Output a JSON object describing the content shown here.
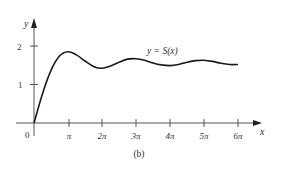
{
  "chart_data": {
    "type": "line",
    "title": "",
    "caption": "(b)",
    "xlabel": "x",
    "ylabel": "y",
    "curve_label": "y = S(x)",
    "x_ticks": [
      "π",
      "2π",
      "3π",
      "4π",
      "5π",
      "6π"
    ],
    "x_tick_values": [
      3.1416,
      6.2832,
      9.4248,
      12.5664,
      15.708,
      18.8496
    ],
    "y_ticks": [
      "1",
      "2"
    ],
    "y_tick_values": [
      1,
      2
    ],
    "origin_label": "0",
    "xlim": [
      0,
      20.0
    ],
    "ylim": [
      0,
      2.3
    ],
    "grid": false,
    "legend": "none",
    "series": [
      {
        "name": "y = S(x)",
        "x_units_of_pi": [
          0,
          0.25,
          0.5,
          0.75,
          1.0,
          1.25,
          1.5,
          1.75,
          2.0,
          2.25,
          2.5,
          2.75,
          3.0,
          3.25,
          3.5,
          3.75,
          4.0,
          4.25,
          4.5,
          4.75,
          5.0,
          5.25,
          5.5,
          5.75,
          6.0
        ],
        "values": [
          0,
          0.76,
          1.37,
          1.74,
          1.85,
          1.77,
          1.61,
          1.47,
          1.42,
          1.48,
          1.58,
          1.66,
          1.67,
          1.63,
          1.56,
          1.51,
          1.49,
          1.52,
          1.58,
          1.62,
          1.63,
          1.6,
          1.55,
          1.52,
          1.52
        ]
      }
    ]
  },
  "labels": {
    "y_axis": "y",
    "x_axis": "x",
    "origin": "0",
    "tick_y1": "1",
    "tick_y2": "2",
    "tick_x1": "π",
    "tick_x2": "2π",
    "tick_x3": "3π",
    "tick_x4": "4π",
    "tick_x5": "5π",
    "tick_x6": "6π",
    "curve_label": "y = S(x)",
    "caption": "(b)"
  },
  "colors": {
    "axis": "#555555",
    "curve": "#1a1a1a",
    "text": "#333333"
  }
}
